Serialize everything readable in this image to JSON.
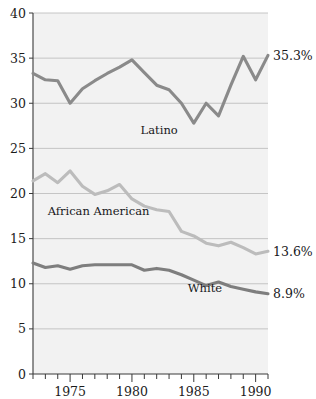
{
  "chart_data": {
    "type": "line",
    "title": "",
    "subtitle": "",
    "xlabel": "",
    "ylabel": "",
    "xlim": [
      1972,
      1991
    ],
    "ylim": [
      0,
      40
    ],
    "grid": true,
    "legend_position": "inline-annotations",
    "y_ticks": [
      0,
      5,
      10,
      15,
      20,
      25,
      30,
      35,
      40
    ],
    "y_tick_labels": [
      "0",
      "5",
      "10",
      "15",
      "20",
      "25",
      "30",
      "35",
      "40"
    ],
    "x_ticks": [
      1972,
      1973,
      1974,
      1975,
      1976,
      1977,
      1978,
      1979,
      1980,
      1981,
      1982,
      1983,
      1984,
      1985,
      1986,
      1987,
      1988,
      1989,
      1990,
      1991
    ],
    "x_tick_labels_shown": [
      "1975",
      "1980",
      "1985",
      "1990"
    ],
    "x_labeled_ticks": [
      1975,
      1980,
      1985,
      1990
    ],
    "x": [
      1972,
      1973,
      1974,
      1975,
      1976,
      1977,
      1978,
      1979,
      1980,
      1981,
      1982,
      1983,
      1984,
      1985,
      1986,
      1987,
      1988,
      1989,
      1990,
      1991
    ],
    "series": [
      {
        "name": "Latino",
        "color": "#8a8a8a",
        "label_text": "Latino",
        "end_label": "35.3%",
        "end_value": 35.3,
        "values": [
          33.3,
          32.6,
          32.5,
          30.0,
          31.6,
          32.5,
          33.3,
          34.0,
          34.8,
          33.4,
          32.0,
          31.5,
          30.0,
          27.8,
          30.0,
          28.6,
          32.0,
          35.2,
          32.6,
          35.3
        ]
      },
      {
        "name": "African American",
        "color": "#bcbcbc",
        "label_text": "African American",
        "end_label": "13.6%",
        "end_value": 13.6,
        "values": [
          21.4,
          22.2,
          21.2,
          22.5,
          20.8,
          19.9,
          20.3,
          21.0,
          19.4,
          18.6,
          18.2,
          18.0,
          15.8,
          15.3,
          14.5,
          14.2,
          14.6,
          14.0,
          13.3,
          13.6
        ]
      },
      {
        "name": "White",
        "color": "#7e7e7e",
        "label_text": "White",
        "end_label": "8.9%",
        "end_value": 8.9,
        "values": [
          12.3,
          11.8,
          12.0,
          11.6,
          12.0,
          12.1,
          12.1,
          12.1,
          12.1,
          11.5,
          11.7,
          11.5,
          11.0,
          10.4,
          9.8,
          10.2,
          9.7,
          9.4,
          9.1,
          8.9
        ]
      }
    ],
    "annotations": [
      {
        "text": "Latino",
        "x": 1982.2,
        "y": 26.6
      },
      {
        "text": "African American",
        "x": 1977.3,
        "y": 17.6
      },
      {
        "text": "White",
        "x": 1985.9,
        "y": 9.1
      },
      {
        "text": "35.3%",
        "x": 1991.4,
        "y": 35.3
      },
      {
        "text": "13.6%",
        "x": 1991.4,
        "y": 13.6
      },
      {
        "text": "8.9%",
        "x": 1991.4,
        "y": 8.9
      }
    ]
  },
  "colors": {
    "plot_background": "#f2f2f2",
    "gridline": "#b9b9b9",
    "axis": "#3a3a3a",
    "text": "#17171a",
    "latino": "#8a8a8a",
    "african_american": "#bcbcbc",
    "white_series": "#7e7e7e"
  }
}
